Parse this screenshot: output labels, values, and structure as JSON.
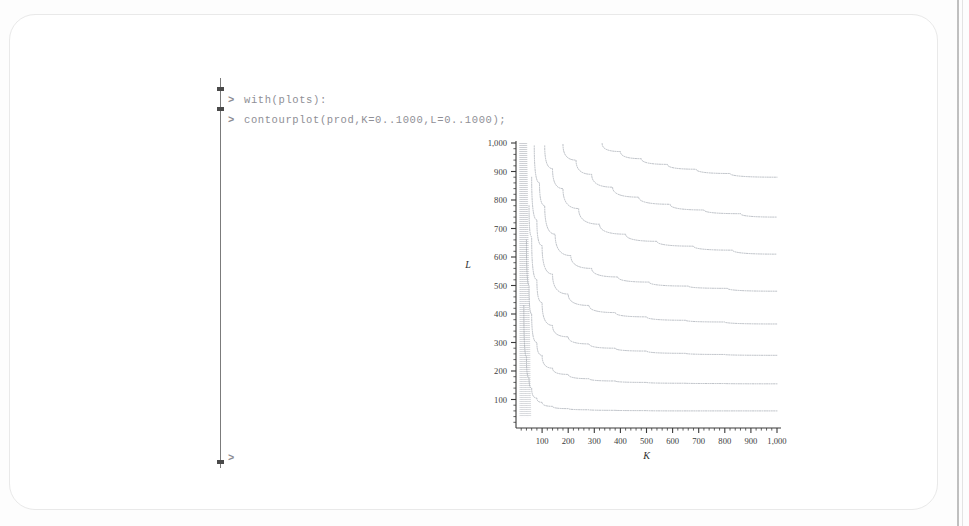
{
  "app": {
    "title": "Maple Worksheet",
    "document_style": "rounded-page"
  },
  "worksheet": {
    "execution_group_label": "execution-group-bracket",
    "prompt_symbol": ">",
    "inputs": [
      {
        "prompt": ">",
        "text": "with(plots):"
      },
      {
        "prompt": ">",
        "text": "contourplot(prod,K=0..1000,L=0..1000);"
      }
    ],
    "trailing_prompt": {
      "prompt": ">",
      "text": ""
    }
  },
  "chart_data": {
    "type": "line",
    "title": "",
    "subtitle": "",
    "plot_kind": "contourplot",
    "xlabel": "K",
    "ylabel": "L",
    "xlim": [
      0,
      1000
    ],
    "ylim": [
      0,
      1000
    ],
    "grid": false,
    "legend": "none",
    "x_ticks": [
      100,
      200,
      300,
      400,
      500,
      600,
      700,
      800,
      900,
      1000
    ],
    "x_tick_labels": [
      "100",
      "200",
      "300",
      "400",
      "500",
      "600",
      "700",
      "800",
      "900",
      "1,000"
    ],
    "y_ticks": [
      100,
      200,
      300,
      400,
      500,
      600,
      700,
      800,
      900,
      1000
    ],
    "y_tick_labels": [
      "100",
      "200",
      "300",
      "400",
      "500",
      "600",
      "700",
      "800",
      "900",
      "1,000"
    ],
    "minor_ticks_per_interval": 4,
    "curve_color": "#9aa0a8",
    "axis_color": "#3a3a3a",
    "series": [
      {
        "name": "contour-1",
        "level": 60,
        "value_at_x1000": 60,
        "x": [
          30,
          40,
          50,
          60,
          80,
          100,
          140,
          200,
          280,
          380,
          500,
          650,
          800,
          1000
        ],
        "y": [
          430,
          250,
          175,
          140,
          105,
          90,
          76,
          68,
          64,
          62,
          61,
          60,
          60,
          60
        ]
      },
      {
        "name": "contour-2",
        "level": 155,
        "value_at_x1000": 155,
        "x": [
          40,
          50,
          60,
          80,
          100,
          140,
          200,
          280,
          380,
          500,
          650,
          800,
          1000
        ],
        "y": [
          660,
          500,
          400,
          300,
          255,
          210,
          188,
          173,
          165,
          160,
          157,
          156,
          155
        ]
      },
      {
        "name": "contour-3",
        "level": 255,
        "value_at_x1000": 255,
        "x": [
          50,
          60,
          80,
          100,
          140,
          200,
          280,
          380,
          500,
          650,
          800,
          1000
        ],
        "y": [
          780,
          670,
          520,
          440,
          360,
          320,
          295,
          280,
          270,
          262,
          258,
          255
        ]
      },
      {
        "name": "contour-4",
        "level": 365,
        "value_at_x1000": 365,
        "x": [
          60,
          80,
          100,
          140,
          200,
          280,
          380,
          500,
          650,
          800,
          1000
        ],
        "y": [
          880,
          730,
          640,
          540,
          470,
          430,
          405,
          390,
          378,
          372,
          365
        ]
      },
      {
        "name": "contour-5",
        "level": 480,
        "value_at_x1000": 480,
        "x": [
          70,
          90,
          110,
          150,
          210,
          290,
          390,
          510,
          660,
          810,
          1000
        ],
        "y": [
          990,
          860,
          780,
          680,
          605,
          560,
          530,
          512,
          498,
          490,
          480
        ]
      },
      {
        "name": "contour-6",
        "level": 610,
        "value_at_x1000": 610,
        "x": [
          110,
          140,
          180,
          240,
          320,
          420,
          540,
          680,
          830,
          1000
        ],
        "y": [
          990,
          910,
          840,
          770,
          715,
          680,
          655,
          638,
          624,
          610
        ]
      },
      {
        "name": "contour-7",
        "level": 740,
        "value_at_x1000": 740,
        "x": [
          180,
          230,
          290,
          370,
          470,
          590,
          720,
          860,
          1000
        ],
        "y": [
          995,
          940,
          890,
          845,
          810,
          785,
          765,
          752,
          740
        ]
      },
      {
        "name": "contour-8",
        "level": 880,
        "value_at_x1000": 880,
        "x": [
          330,
          400,
          480,
          580,
          690,
          820,
          1000
        ],
        "y": [
          998,
          970,
          945,
          925,
          908,
          893,
          880
        ]
      }
    ]
  }
}
